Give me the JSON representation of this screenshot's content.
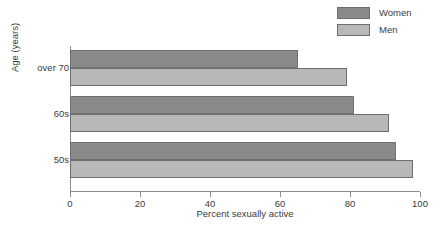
{
  "chart_data": {
    "type": "bar",
    "orientation": "horizontal",
    "title": "",
    "xlabel": "Percent sexually active",
    "ylabel": "Age (years)",
    "categories": [
      "over 70",
      "60s",
      "50s"
    ],
    "series": [
      {
        "name": "Women",
        "color": "#8a8a8a",
        "values": [
          65,
          81,
          93
        ]
      },
      {
        "name": "Men",
        "color": "#b8b8b8",
        "values": [
          79,
          91,
          98
        ]
      }
    ],
    "xlim": [
      0,
      100
    ],
    "xticks": [
      0,
      20,
      40,
      60,
      80,
      100
    ],
    "xtick_labels": [
      "0",
      "20",
      "40",
      "60",
      "80",
      "100"
    ],
    "grid": false,
    "legend_position": "top-right"
  },
  "legend": {
    "items": [
      {
        "label": "Women",
        "color": "#8a8a8a"
      },
      {
        "label": "Men",
        "color": "#b8b8b8"
      }
    ]
  },
  "axes": {
    "x_title": "Percent sexually active",
    "y_title": "Age (years)",
    "x_tick_labels": [
      "0",
      "20",
      "40",
      "60",
      "80",
      "100"
    ],
    "y_tick_labels": [
      "over 70",
      "60s",
      "50s"
    ]
  }
}
